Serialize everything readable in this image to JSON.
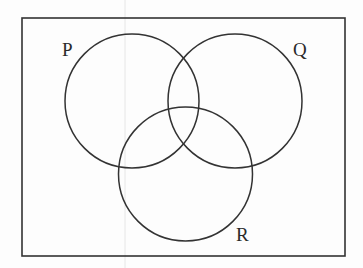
{
  "diagram": {
    "type": "venn",
    "sets": [
      {
        "id": "P",
        "label": "P",
        "cx": 132,
        "cy": 101,
        "r": 67
      },
      {
        "id": "Q",
        "label": "Q",
        "cx": 235,
        "cy": 101,
        "r": 67
      },
      {
        "id": "R",
        "label": "R",
        "cx": 185.5,
        "cy": 174,
        "r": 67
      }
    ],
    "universe": {
      "x": 22,
      "y": 18,
      "width": 323,
      "height": 238
    },
    "colors": {
      "stroke": "#333333",
      "background": "#fdfdfd",
      "scan_line": "#e4e4e4"
    }
  }
}
